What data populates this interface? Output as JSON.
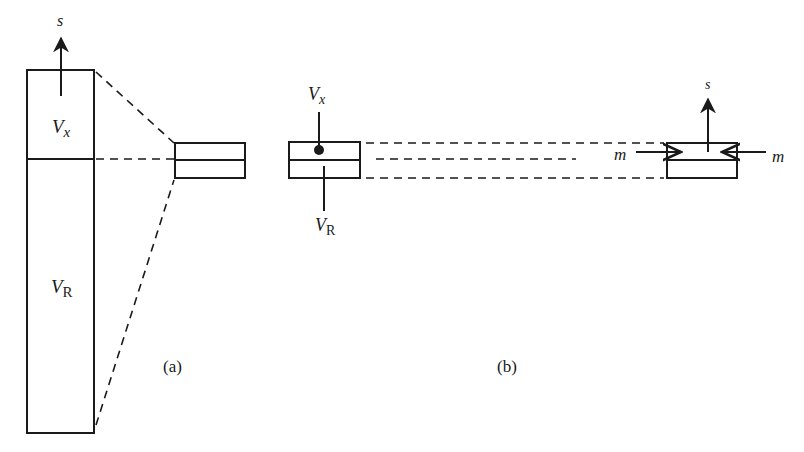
{
  "diagram": {
    "panel_a": {
      "caption": "(a)",
      "large_block": {
        "top_label": "V",
        "top_label_sub": "x",
        "bottom_label": "V",
        "bottom_label_sub": "R",
        "arrow_label": "s"
      }
    },
    "panel_b": {
      "caption": "(b)",
      "left_block": {
        "top_pointer_label": "V",
        "top_pointer_sub": "x",
        "bottom_pointer_label": "V",
        "bottom_pointer_sub": "R"
      },
      "right_block": {
        "arrow_label": "s",
        "left_arrow_label": "m",
        "right_arrow_label": "m"
      }
    },
    "colors": {
      "ink": "#1a1a1a",
      "background": "#ffffff"
    }
  }
}
